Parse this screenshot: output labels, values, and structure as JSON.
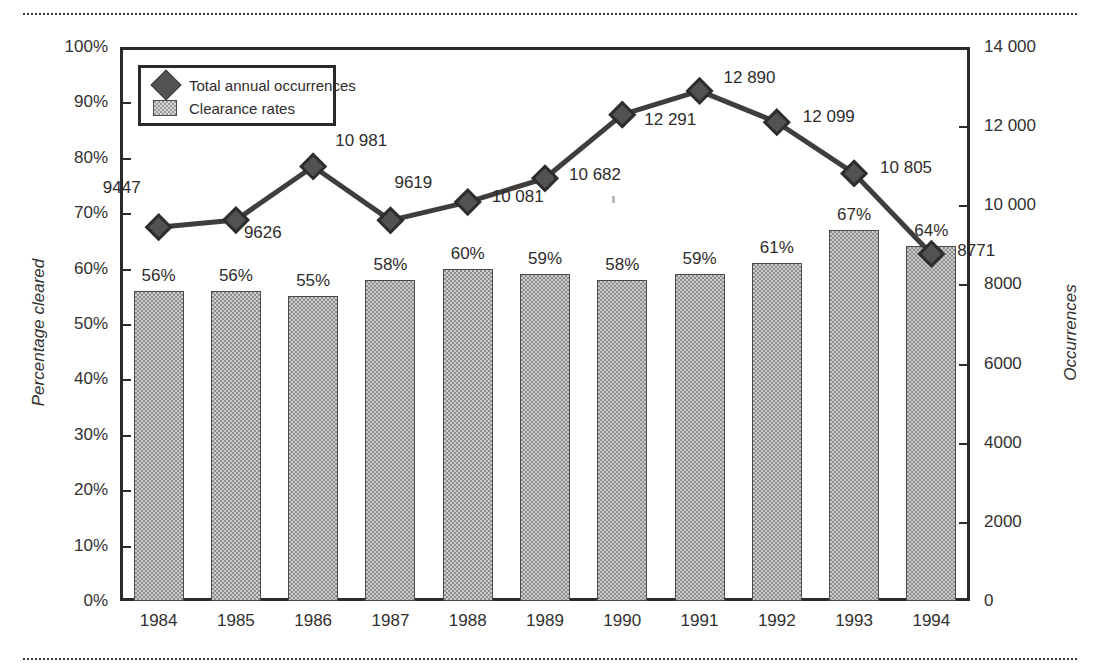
{
  "chart_data": {
    "type": "bar",
    "title": "",
    "categories": [
      "1984",
      "1985",
      "1986",
      "1987",
      "1988",
      "1989",
      "1990",
      "1991",
      "1992",
      "1993",
      "1994"
    ],
    "xlabel": "",
    "grid": false,
    "legend_position": "top-left",
    "series": [
      {
        "name": "Clearance rates",
        "type": "bar",
        "axis": "left",
        "values": [
          56,
          56,
          55,
          58,
          60,
          59,
          58,
          59,
          61,
          67,
          64
        ],
        "value_labels": [
          "56%",
          "56%",
          "55%",
          "58%",
          "60%",
          "59%",
          "58%",
          "59%",
          "61%",
          "67%",
          "64%"
        ],
        "color": "#8e8e8e"
      },
      {
        "name": "Total annual occurrences",
        "type": "line",
        "axis": "right",
        "values": [
          9447,
          9626,
          10981,
          9619,
          10081,
          10682,
          12291,
          12890,
          12099,
          10805,
          8771
        ],
        "value_labels": [
          "9447",
          "9626",
          "10 981",
          "9619",
          "10 081",
          "10 682",
          "12 291",
          "12 890",
          "12 099",
          "10 805",
          "8771"
        ],
        "color": "#403d3d"
      }
    ],
    "axis_left": {
      "label": "Percentage cleared",
      "ylim": [
        0,
        100
      ],
      "ticks": [
        "0%",
        "10%",
        "20%",
        "30%",
        "40%",
        "50%",
        "60%",
        "70%",
        "80%",
        "90%",
        "100%"
      ]
    },
    "axis_right": {
      "label": "Occurrences",
      "ylim": [
        0,
        14000
      ],
      "ticks": [
        "0",
        "2000",
        "4000",
        "6000",
        "8000",
        "10 000",
        "12 000",
        "14 000"
      ]
    }
  },
  "legend": {
    "items": [
      {
        "label": "Total annual occurrences",
        "marker": "diamond-icon"
      },
      {
        "label": "Clearance rates",
        "marker": "bar-swatch-icon"
      }
    ]
  }
}
